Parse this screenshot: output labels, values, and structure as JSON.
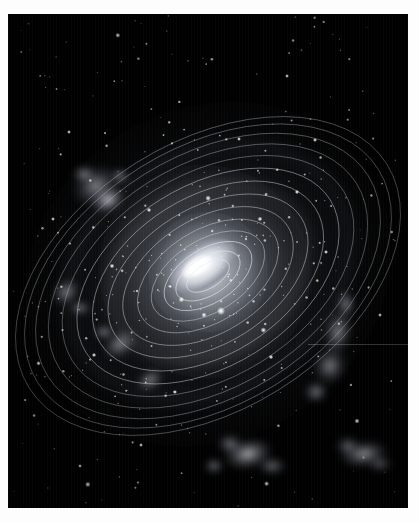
{
  "page": {
    "background_color": "#fdfdfd",
    "plate_background_color": "#000000"
  },
  "figure": {
    "title": "Spiral galaxy with concentric orbital rings",
    "medium": "grayscale astronomical plate",
    "plate": {
      "x": 8,
      "y": 14,
      "width": 400,
      "height": 494
    }
  },
  "scene": {
    "objects": [
      {
        "name": "galactic-nucleus",
        "label": "Galactic nucleus",
        "cx": 195,
        "cy": 252,
        "rx": 37,
        "ry": 21,
        "rotation_deg": -34,
        "brightness": "peak"
      },
      {
        "name": "galactic-bulge",
        "label": "Central bulge",
        "cx": 197,
        "cy": 255,
        "rx": 60,
        "ry": 60,
        "rotation_deg": -32,
        "brightness": "high"
      },
      {
        "name": "galactic-disk-haze",
        "label": "Disk haze",
        "cx": 200,
        "cy": 260,
        "rx": 190,
        "ry": 165,
        "rotation_deg": -32,
        "brightness": "low"
      },
      {
        "name": "nebula-upper-left",
        "label": "Upper-left star-forming region",
        "cx": 92,
        "cy": 178,
        "rx": 34,
        "ry": 30,
        "brightness": "medium"
      },
      {
        "name": "nebula-left",
        "label": "Left spur complex",
        "cx": 62,
        "cy": 281,
        "rx": 22,
        "ry": 20,
        "brightness": "medium"
      },
      {
        "name": "nebula-right-arm",
        "label": "Right arm knot chain",
        "cx": 330,
        "cy": 330,
        "rx": 30,
        "ry": 42,
        "brightness": "medium"
      },
      {
        "name": "nebula-lower-center",
        "label": "Lower foreground cluster",
        "cx": 245,
        "cy": 447,
        "rx": 38,
        "ry": 22,
        "brightness": "high"
      },
      {
        "name": "nebula-lower-right",
        "label": "Lower-right companion cloud",
        "cx": 358,
        "cy": 445,
        "rx": 32,
        "ry": 20,
        "brightness": "high"
      },
      {
        "name": "bright-star-foreground",
        "label": "Foreground field star",
        "cx": 213,
        "cy": 297,
        "rx": 5,
        "ry": 5,
        "brightness": "peak"
      }
    ],
    "rings": {
      "label": "Concentric elliptical orbit traces",
      "count": 14,
      "rotation_deg": -32,
      "center_x": 200,
      "center_y": 262,
      "stroke_color": "#c9cdd6",
      "semi_major_axes": [
        24,
        36,
        49,
        63,
        78,
        94,
        110,
        127,
        144,
        160,
        175,
        189,
        201,
        211
      ],
      "semi_minor_axes": [
        12,
        19,
        27,
        36,
        46,
        57,
        68,
        79,
        90,
        101,
        111,
        120,
        128,
        134
      ]
    },
    "artifacts": [
      {
        "name": "horizontal-scratch",
        "label": "Plate scratch",
        "x": 300,
        "y": 330,
        "width": 108,
        "height": 1
      },
      {
        "name": "vertical-scan-striping",
        "label": "Vertical scan striping",
        "spacing_px": 3
      }
    ]
  },
  "chart_data": {
    "type": "scatter",
    "title": "Spiral galaxy with concentric orbital rings",
    "xlabel": "",
    "ylabel": "",
    "grid": false,
    "legend": "none",
    "categories": [],
    "values": []
  }
}
